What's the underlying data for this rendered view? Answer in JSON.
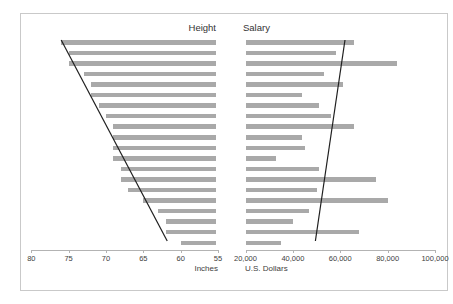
{
  "figure": {
    "left_title": "Height",
    "right_title": "Salary",
    "left_unit": "Inches",
    "right_unit": "U.S. Dollars",
    "bar_color": "#a9a9a9",
    "trend_line_color": "#1f1f1f",
    "axis_color": "#b3b3b3"
  },
  "chart_data": [
    {
      "type": "bar",
      "orientation": "horizontal",
      "title": "Height",
      "xlabel": "Inches",
      "xlim": [
        80,
        55
      ],
      "x_ticks": [
        {
          "value": 80,
          "label": "80"
        },
        {
          "value": 75,
          "label": "75"
        },
        {
          "value": 70,
          "label": "70"
        },
        {
          "value": 65,
          "label": "65"
        },
        {
          "value": 60,
          "label": "60"
        },
        {
          "value": 55,
          "label": "55"
        }
      ],
      "bars_anchored_at": 55,
      "values": [
        76,
        75,
        75,
        73,
        72,
        72,
        71,
        70,
        69,
        69,
        69,
        69,
        68,
        68,
        67,
        65,
        63,
        62,
        62,
        60
      ],
      "trend_line": {
        "top_value": 76,
        "bottom_value": 61.8
      },
      "grid": false,
      "legend": false
    },
    {
      "type": "bar",
      "orientation": "horizontal",
      "title": "Salary",
      "xlabel": "U.S. Dollars",
      "xlim": [
        20000,
        100000
      ],
      "x_ticks": [
        {
          "value": 20000,
          "label": "20,000"
        },
        {
          "value": 40000,
          "label": "40,000"
        },
        {
          "value": 60000,
          "label": "60,000"
        },
        {
          "value": 80000,
          "label": "80,000"
        },
        {
          "value": 100000,
          "label": "100,000"
        }
      ],
      "bars_anchored_at": 20000,
      "values": [
        66000,
        58000,
        84000,
        53000,
        61000,
        44000,
        51000,
        56000,
        66000,
        44000,
        45000,
        33000,
        51000,
        75000,
        50000,
        80000,
        47000,
        40000,
        68000,
        35000
      ],
      "trend_line": {
        "top_value": 62000,
        "bottom_value": 49500
      },
      "grid": false,
      "legend": false
    }
  ]
}
